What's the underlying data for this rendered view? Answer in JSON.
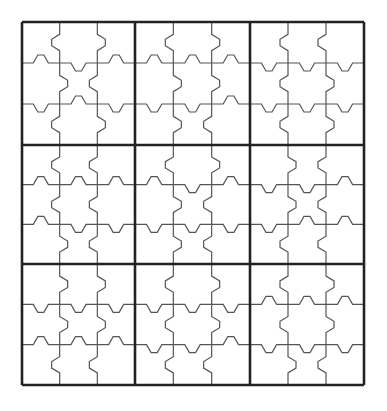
{
  "puzzle": {
    "type": "jigsaw-grid",
    "rows": 9,
    "cols": 9,
    "box_rows": 3,
    "box_cols": 3,
    "grid_left": 22,
    "grid_top": 22,
    "box_x": [
      22,
      135,
      250,
      364
    ],
    "box_y": [
      22,
      145,
      264,
      385
    ],
    "colors": {
      "thick_line": "#222222",
      "thin_line": "#555555",
      "background": "#ffffff"
    },
    "cells_filled": 0,
    "boxes": [
      {
        "r": 0,
        "c": 0,
        "h1": [
          "u",
          "d",
          "u"
        ],
        "h2": [
          "d",
          "u",
          "d"
        ],
        "v1": [
          "l",
          "r",
          "l"
        ],
        "v2": [
          "r",
          "l",
          "r"
        ]
      },
      {
        "r": 0,
        "c": 1,
        "h1": [
          "u",
          "u",
          "u"
        ],
        "h2": [
          "d",
          "d",
          "u"
        ],
        "v1": [
          "l",
          "r",
          "r"
        ],
        "v2": [
          "r",
          "r",
          "l"
        ]
      },
      {
        "r": 0,
        "c": 2,
        "h1": [
          "d",
          "d",
          "d"
        ],
        "h2": [
          "d",
          "d",
          "d"
        ],
        "v1": [
          "l",
          "l",
          "l"
        ],
        "v2": [
          "l",
          "r",
          "r"
        ]
      },
      {
        "r": 1,
        "c": 0,
        "h1": [
          "u",
          "u",
          "u"
        ],
        "h2": [
          "u",
          "d",
          "d"
        ],
        "v1": [
          "l",
          "l",
          "r"
        ],
        "v2": [
          "l",
          "l",
          "l"
        ]
      },
      {
        "r": 1,
        "c": 1,
        "h1": [
          "u",
          "d",
          "u"
        ],
        "h2": [
          "d",
          "d",
          "d"
        ],
        "v1": [
          "l",
          "r",
          "r"
        ],
        "v2": [
          "r",
          "l",
          "l"
        ]
      },
      {
        "r": 1,
        "c": 2,
        "h1": [
          "d",
          "d",
          "u"
        ],
        "h2": [
          "d",
          "u",
          "u"
        ],
        "v1": [
          "r",
          "r",
          "l"
        ],
        "v2": [
          "l",
          "l",
          "l"
        ]
      },
      {
        "r": 2,
        "c": 0,
        "h1": [
          "d",
          "d",
          "d"
        ],
        "h2": [
          "u",
          "u",
          "u"
        ],
        "v1": [
          "r",
          "r",
          "l"
        ],
        "v2": [
          "r",
          "r",
          "l"
        ]
      },
      {
        "r": 2,
        "c": 1,
        "h1": [
          "d",
          "d",
          "d"
        ],
        "h2": [
          "d",
          "d",
          "u"
        ],
        "v1": [
          "l",
          "l",
          "l"
        ],
        "v2": [
          "r",
          "r",
          "l"
        ]
      },
      {
        "r": 2,
        "c": 2,
        "h1": [
          "u",
          "u",
          "u"
        ],
        "h2": [
          "d",
          "d",
          "d"
        ],
        "v1": [
          "l",
          "l",
          "r"
        ],
        "v2": [
          "r",
          "r",
          "l"
        ]
      }
    ]
  }
}
